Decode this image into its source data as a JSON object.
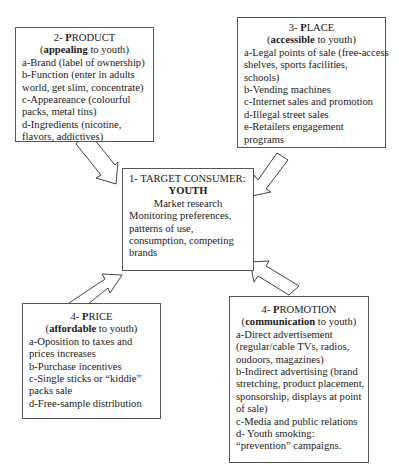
{
  "diagram": {
    "target": {
      "title": "1- TARGET CONSUMER:",
      "subtitle": "YOUTH",
      "heading": "Market research",
      "lines": [
        "Monitoring preferences,",
        "patterns of use,",
        "consumption, competing",
        "brands"
      ]
    },
    "product": {
      "number": "2- ",
      "initial": "P",
      "rest": "RODUCT",
      "qualifier_bold": "appealing",
      "qualifier_rest": " to youth)",
      "lines": [
        "a-Brand (label of ownership)",
        "b-Function (enter in adults",
        "world, get slim, concentrate)",
        "c-Appeareance (colourful",
        "packs, metal tins)",
        "d-Ingredients (nicotine,",
        "flavors, addictives)"
      ]
    },
    "place": {
      "number": "3- ",
      "initial": "P",
      "rest": "LACE",
      "qualifier_bold": "accessible",
      "qualifier_rest": " to youth)",
      "lines": [
        "a-Legal points of sale (free-access",
        "shelves, sports facilities,",
        "schools)",
        "b-Vending machines",
        "c-Internet sales and promotion",
        "d-Illegal street sales",
        "e-Retailers engagement",
        "programs"
      ]
    },
    "price": {
      "number": "4- ",
      "initial": "P",
      "rest": "RICE",
      "qualifier_bold": "affordable",
      "qualifier_rest": " to youth)",
      "lines": [
        "a-Oposition to taxes and",
        "prices increases",
        "b-Purchase incentives",
        "c-Single sticks or “kiddie”",
        "packs sale",
        "d-Free-sample distribution"
      ]
    },
    "promotion": {
      "number": "4- ",
      "initial": "P",
      "rest": "ROMOTION",
      "qualifier_bold": "communication",
      "qualifier_rest": " to youth)",
      "lines": [
        "a-Direct advertisement",
        "(regular/cable TVs, radios,",
        "oudoors, magazines)",
        "b-Indirect advertising (brand",
        "stretching, product placement,",
        "sponsorship, displays at point",
        "of sale)",
        "c-Media and public relations",
        "d- Youth smoking:",
        "“prevention” campaigns."
      ]
    },
    "open_paren": "("
  }
}
